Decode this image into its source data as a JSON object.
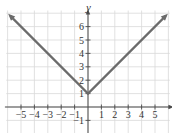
{
  "chart_data": {
    "type": "line",
    "title": "",
    "function": "y = |x| + 1",
    "xlabel": "",
    "ylabel": "y",
    "xlim": [
      -6,
      6
    ],
    "ylim": [
      -2,
      7
    ],
    "x_ticks": [
      "-5",
      "-4",
      "-3",
      "-2",
      "-1",
      "1",
      "2",
      "3",
      "4",
      "5"
    ],
    "y_ticks": [
      "1",
      "2",
      "3",
      "4",
      "5",
      "6",
      "-1"
    ],
    "grid": true,
    "series": [
      {
        "name": "y = |x| + 1",
        "x": [
          -5.8,
          0,
          5.8
        ],
        "y": [
          6.8,
          1,
          6.8
        ],
        "color": "#6b6b6b",
        "arrows_both_ends": true
      }
    ],
    "colors": {
      "grid": "#d9d9d9",
      "axis": "#4a4a4a",
      "line": "#6b6b6b",
      "text": "#333333"
    }
  }
}
